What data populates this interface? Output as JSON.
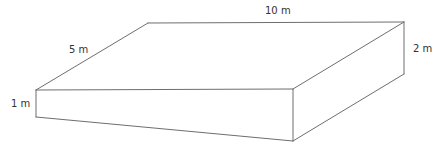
{
  "diagram": {
    "type": "wedge-prism",
    "labels": {
      "length": "10 m",
      "width": "5 m",
      "deep_end": "2 m",
      "shallow_end": "1 m"
    },
    "colors": {
      "stroke": "#6e6e6e",
      "text": "#333333",
      "background": "#ffffff"
    },
    "vertices": {
      "front_left_top": [
        36,
        90
      ],
      "front_left_bottom": [
        36,
        117
      ],
      "back_left_top": [
        148,
        23
      ],
      "back_right_top": [
        404,
        22
      ],
      "back_right_bottom": [
        404,
        74
      ],
      "front_right_top": [
        293,
        89
      ],
      "front_right_bottom": [
        293,
        141
      ]
    }
  }
}
